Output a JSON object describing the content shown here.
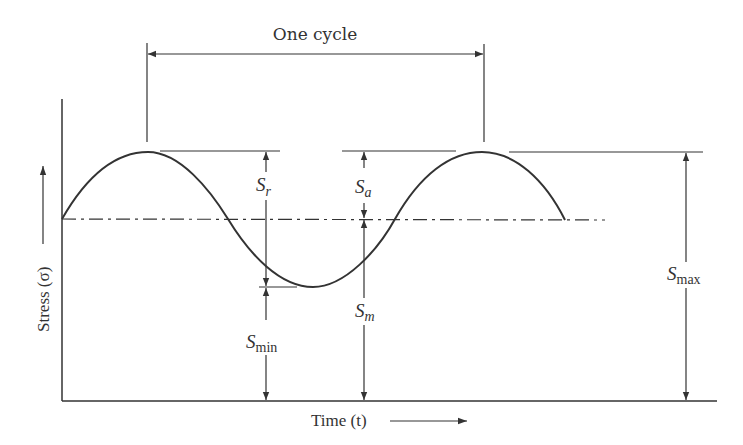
{
  "diagram": {
    "cycle_label": "One cycle",
    "x_axis_label": "Time (t)",
    "y_axis_label": "Stress (σ)",
    "labels": {
      "s_r": {
        "main": "S",
        "sub": "r"
      },
      "s_a": {
        "main": "S",
        "sub": "a"
      },
      "s_m": {
        "main": "S",
        "sub": "m"
      },
      "s_min": {
        "main": "S",
        "sub": "min"
      },
      "s_max": {
        "main": "S",
        "sub": "max"
      }
    },
    "colors": {
      "line": "#333333",
      "background": "#ffffff"
    },
    "components": [
      "sinusoidal stress curve",
      "mean stress dash-dot line",
      "stress range S_r",
      "stress amplitude S_a",
      "mean stress S_m",
      "minimum stress S_min",
      "maximum stress S_max",
      "one cycle dimension"
    ]
  }
}
